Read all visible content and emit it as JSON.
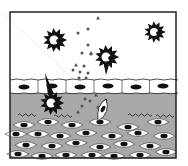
{
  "figure": {
    "frame": {
      "x": 10,
      "y": 12,
      "w": 166,
      "h": 146,
      "stroke": "#222222"
    },
    "colors": {
      "background": "#ffffff",
      "tissue_grey": "#a9a9a9",
      "cell_fill": "#ffffff",
      "nucleus": "#111111",
      "outline": "#222222",
      "particle": "#555555"
    },
    "layers": {
      "lumen": {
        "y0": 12,
        "y1": 80
      },
      "epithelium": {
        "y0": 80,
        "y1": 93
      },
      "lamina": {
        "y0": 93,
        "y1": 158
      }
    },
    "epithelial_cells": [
      {
        "cx": 24,
        "cy": 87
      },
      {
        "cx": 52,
        "cy": 86
      },
      {
        "cx": 80,
        "cy": 87
      },
      {
        "cx": 108,
        "cy": 86
      },
      {
        "cx": 136,
        "cy": 87
      },
      {
        "cx": 163,
        "cy": 86
      }
    ],
    "pathogens": [
      {
        "cx": 55,
        "cy": 40,
        "r": 9,
        "label": "spiky-pathogen"
      },
      {
        "cx": 107,
        "cy": 57,
        "r": 9,
        "label": "spiky-pathogen"
      },
      {
        "cx": 155,
        "cy": 32,
        "r": 8,
        "label": "spiky-pathogen"
      }
    ],
    "dendritic_cell": {
      "cx": 52,
      "cy": 103,
      "r": 9,
      "dendrite_top": {
        "x": 45,
        "y": 73
      }
    },
    "migrating_cell": {
      "cx": 103,
      "cy": 111
    },
    "particles": {
      "dots": [
        [
          78,
          33
        ],
        [
          88,
          29
        ],
        [
          88,
          45
        ],
        [
          82,
          53
        ],
        [
          91,
          54
        ],
        [
          84,
          66
        ],
        [
          80,
          72
        ],
        [
          88,
          73
        ],
        [
          73,
          70
        ],
        [
          86,
          78
        ],
        [
          79,
          78
        ],
        [
          85,
          99
        ],
        [
          103,
          108
        ],
        [
          106,
          100
        ],
        [
          82,
          106
        ],
        [
          90,
          101
        ]
      ],
      "triangles": [
        [
          98,
          18
        ],
        [
          91,
          53
        ],
        [
          76,
          65
        ],
        [
          96,
          95
        ],
        [
          78,
          112
        ],
        [
          105,
          108
        ],
        [
          98,
          107
        ]
      ]
    },
    "wavy_fibers": [
      {
        "x": 18,
        "y": 115,
        "w": 18
      },
      {
        "x": 54,
        "y": 116,
        "w": 16
      },
      {
        "x": 128,
        "y": 115,
        "w": 22
      },
      {
        "x": 156,
        "y": 116,
        "w": 18
      }
    ],
    "stromal_cells": [
      [
        24,
        125
      ],
      [
        48,
        122
      ],
      [
        72,
        125
      ],
      [
        100,
        122
      ],
      [
        128,
        127
      ],
      [
        158,
        122
      ],
      [
        16,
        134
      ],
      [
        38,
        134
      ],
      [
        60,
        136
      ],
      [
        86,
        133
      ],
      [
        112,
        136
      ],
      [
        138,
        133
      ],
      [
        164,
        136
      ],
      [
        26,
        145
      ],
      [
        52,
        146
      ],
      [
        76,
        143
      ],
      [
        100,
        147
      ],
      [
        124,
        144
      ],
      [
        150,
        146
      ],
      [
        18,
        154
      ],
      [
        42,
        156
      ],
      [
        66,
        155
      ],
      [
        92,
        155
      ],
      [
        114,
        156
      ],
      [
        140,
        155
      ],
      [
        166,
        152
      ]
    ]
  }
}
